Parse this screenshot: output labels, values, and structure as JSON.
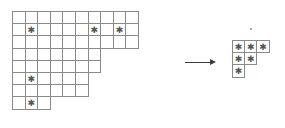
{
  "figure": {
    "type": "young-diagram-transformation",
    "arrow": {
      "symbol": "→",
      "label": "",
      "direction": "right"
    },
    "marker_glyph": "✱",
    "colors": {
      "cell_border": "#8a8a8a",
      "marker": "#555555",
      "arrow": "#3b3b3b",
      "background": "#ffffff"
    },
    "source": {
      "name": "source-shape",
      "origin": {
        "x": 12,
        "y": 11
      },
      "cell_width": 13.6,
      "cell_height": 13.2,
      "row_lengths": [
        10,
        10,
        10,
        7,
        7,
        6,
        6,
        3
      ],
      "rows": [
        {
          "index": 1,
          "length": 10,
          "marked_columns": []
        },
        {
          "index": 2,
          "length": 10,
          "marked_columns": [
            2,
            7,
            9
          ]
        },
        {
          "index": 3,
          "length": 10,
          "marked_columns": []
        },
        {
          "index": 4,
          "length": 7,
          "marked_columns": []
        },
        {
          "index": 5,
          "length": 7,
          "marked_columns": []
        },
        {
          "index": 6,
          "length": 6,
          "marked_columns": [
            2,
            7
          ]
        },
        {
          "index": 7,
          "length": 6,
          "marked_columns": []
        },
        {
          "index": 8,
          "length": 3,
          "marked_columns": [
            2
          ]
        }
      ],
      "total_cells": 59,
      "total_marked": 6
    },
    "target": {
      "name": "target-shape",
      "origin": {
        "x": 232,
        "y": 40
      },
      "cell_width": 13.2,
      "cell_height": 13.2,
      "row_lengths": [
        3,
        2,
        1
      ],
      "rows": [
        {
          "index": 1,
          "length": 3,
          "marked_columns": [
            1,
            2,
            3
          ]
        },
        {
          "index": 2,
          "length": 2,
          "marked_columns": [
            1,
            2
          ]
        },
        {
          "index": 3,
          "length": 1,
          "marked_columns": [
            1
          ]
        }
      ],
      "total_cells": 6,
      "total_marked": 6
    }
  }
}
